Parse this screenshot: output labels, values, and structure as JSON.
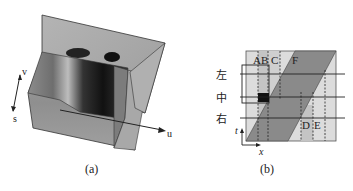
{
  "figure": {
    "panels": [
      {
        "id": "a",
        "caption": "(a)",
        "description": "3D volume rendering with slices",
        "axes": {
          "v_label": "v",
          "s_label": "s",
          "u_label": "u"
        }
      },
      {
        "id": "b",
        "caption": "(b)",
        "region_labels": {
          "A": "A",
          "B": "B",
          "C": "C",
          "D": "D",
          "E": "E",
          "F": "F"
        },
        "row_labels": [
          "左",
          "中",
          "右"
        ],
        "axis_labels": {
          "t": "t",
          "x": "x"
        }
      }
    ],
    "colors": {
      "background": "#ffffff",
      "frame_fill": "#d9d9d9",
      "light_band": "#c4c4c4",
      "parallelogram": "#8a8a8a",
      "marker": "#111111",
      "line": "#222222"
    }
  }
}
